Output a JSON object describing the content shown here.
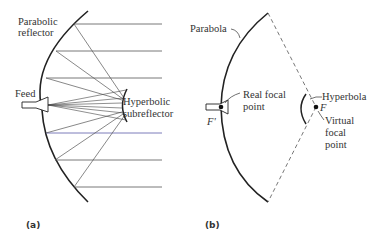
{
  "panel_a": {
    "caption": "(a)",
    "labels": {
      "reflector_line1": "Parabolic",
      "reflector_line2": "reflector",
      "feed": "Feed",
      "sub_line1": "Hyperbolic",
      "sub_line2": "subreflector"
    }
  },
  "panel_b": {
    "caption": "(b)",
    "labels": {
      "parabola": "Parabola",
      "real_line1": "Real focal",
      "real_line2": "point",
      "f_prime": "F'",
      "hyperbola": "Hyperbola",
      "f": "F",
      "virtual_line1": "Virtual",
      "virtual_line2": "focal",
      "virtual_line3": "point"
    }
  },
  "colors": {
    "stroke": "#222222",
    "ray": "#444444",
    "highlight_ray": "#5a5aa8"
  }
}
